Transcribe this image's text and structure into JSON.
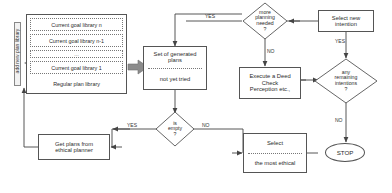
{
  "diagram": {
    "side_label": "add new plan library",
    "goal_library": {
      "items": [
        "Current goal library n",
        "Current goal library n-1",
        "...",
        "Current goal library 1",
        "Regular plan library"
      ]
    },
    "nodes": {
      "plans": {
        "line1": "Set of generated",
        "line2": "plans",
        "line3": "not yet tried"
      },
      "more_planning": {
        "line1": "more",
        "line2": "planning",
        "line3": "needed",
        "line4": "?"
      },
      "select_new_intention": {
        "line1": "Select new",
        "line2": "intention"
      },
      "execute": {
        "line1": "Execute a Deed",
        "line2": "Check",
        "line3": "Perception etc.,"
      },
      "any_remaining": {
        "line1": "any",
        "line2": "remaining",
        "line3": "intentions",
        "line4": "?"
      },
      "stop": {
        "label": "STOP"
      },
      "is_empty": {
        "line1": "is",
        "line2": "empty",
        "line3": "?"
      },
      "ethical_planner": {
        "line1": "Get plans from",
        "line2": "ethical planner"
      },
      "select": {
        "line1": "Select",
        "line2": "the most ethical"
      }
    },
    "edge_labels": {
      "yes_more_planning": "YES",
      "yes_any_remaining": "YES",
      "no_more_planning": "NO",
      "no_any_remaining": "NO",
      "yes_is_empty": "YES",
      "no_is_empty": "NO"
    },
    "colors": {
      "stroke": "#555555",
      "text": "#2b2b2b",
      "thick_arrow": "#808080",
      "dotted": "#777777"
    }
  }
}
